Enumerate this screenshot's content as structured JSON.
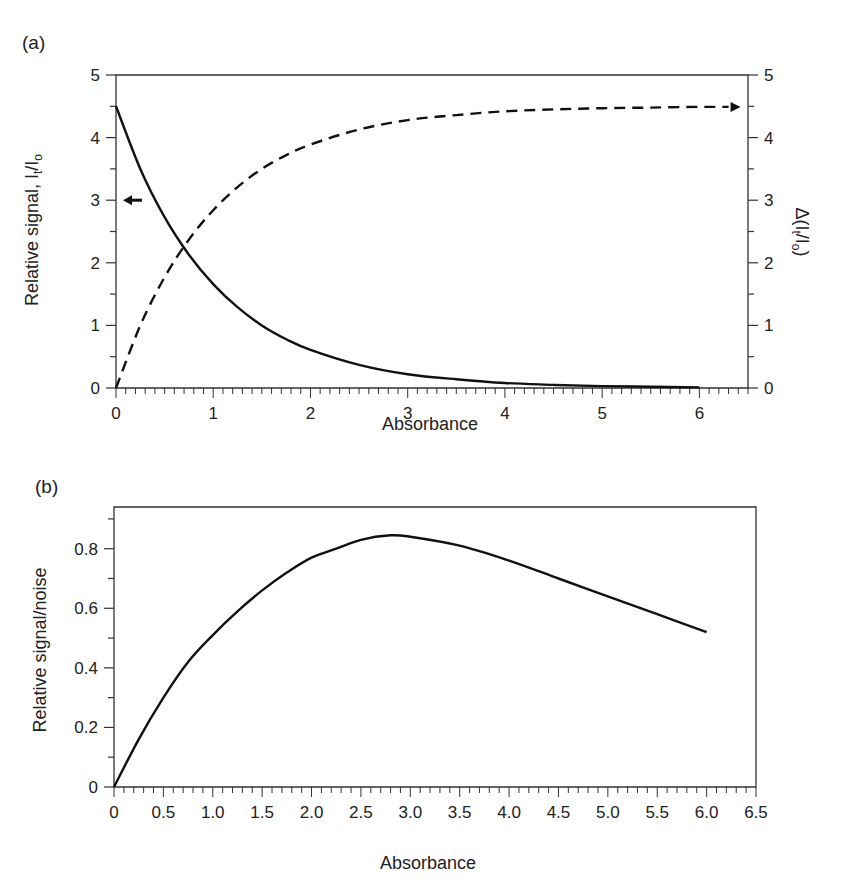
{
  "chart_data": [
    {
      "panel": "(a)",
      "type": "line",
      "title": "",
      "xlabel": "Absorbance",
      "ylabel_left": "Relative signal, It/Io",
      "ylabel_right": "Δ(It/Io)",
      "xlim": [
        0,
        6.5
      ],
      "ylim_left": [
        0,
        5
      ],
      "ylim_right": [
        0,
        5
      ],
      "x_ticks": [
        "0",
        "1",
        "2",
        "3",
        "4",
        "5",
        "6"
      ],
      "y_ticks_left": [
        "0",
        "1",
        "2",
        "3",
        "4",
        "5"
      ],
      "y_ticks_right": [
        "0",
        "1",
        "2",
        "3",
        "4",
        "5"
      ],
      "grid": false,
      "series": [
        {
          "name": "Relative signal It/Io",
          "style": "solid",
          "axis": "left",
          "x": [
            0,
            0.25,
            0.5,
            0.75,
            1,
            1.25,
            1.5,
            1.75,
            2,
            2.5,
            3,
            3.5,
            4,
            4.5,
            5,
            5.5,
            6
          ],
          "values": [
            4.5,
            3.5,
            2.73,
            2.13,
            1.66,
            1.29,
            1.0,
            0.78,
            0.61,
            0.37,
            0.22,
            0.14,
            0.08,
            0.05,
            0.03,
            0.02,
            0.01
          ]
        },
        {
          "name": "Δ(It/Io)",
          "style": "dashed",
          "axis": "right",
          "x": [
            0,
            0.25,
            0.5,
            0.75,
            1,
            1.25,
            1.5,
            1.75,
            2,
            2.5,
            3,
            3.5,
            4,
            4.5,
            5,
            5.5,
            6,
            6.3
          ],
          "values": [
            0,
            1.0,
            1.77,
            2.37,
            2.84,
            3.21,
            3.5,
            3.72,
            3.89,
            4.13,
            4.28,
            4.36,
            4.42,
            4.45,
            4.47,
            4.48,
            4.49,
            4.49
          ]
        }
      ],
      "annotations": [
        "left-pointing arrow at y=3 indicating solid curve uses left axis",
        "right-pointing arrow at end of dashed curve indicating right axis"
      ]
    },
    {
      "panel": "(b)",
      "type": "line",
      "title": "",
      "xlabel": "Absorbance",
      "ylabel": "Relative signal/noise",
      "xlim": [
        0,
        6.5
      ],
      "ylim": [
        0,
        0.94
      ],
      "x_ticks": [
        "0",
        "0.5",
        "1.0",
        "1.5",
        "2.0",
        "2.5",
        "3.0",
        "3.5",
        "4.0",
        "4.5",
        "5.0",
        "5.5",
        "6.0",
        "6.5"
      ],
      "y_ticks": [
        "0",
        "0.2",
        "0.4",
        "0.6",
        "0.8"
      ],
      "grid": false,
      "series": [
        {
          "name": "Relative signal/noise",
          "style": "solid",
          "x": [
            0,
            0.25,
            0.5,
            0.75,
            1,
            1.25,
            1.5,
            1.75,
            2,
            2.25,
            2.5,
            2.8,
            3,
            3.5,
            4,
            4.5,
            5,
            5.5,
            6
          ],
          "values": [
            0,
            0.16,
            0.3,
            0.42,
            0.51,
            0.59,
            0.66,
            0.72,
            0.77,
            0.8,
            0.83,
            0.845,
            0.84,
            0.81,
            0.76,
            0.7,
            0.64,
            0.58,
            0.52
          ]
        }
      ]
    }
  ]
}
